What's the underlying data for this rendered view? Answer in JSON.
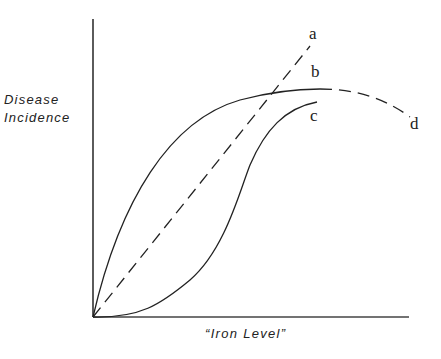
{
  "diagram": {
    "y_axis_label_line1": "Disease",
    "y_axis_label_line2": "Incidence",
    "x_axis_label": "“Iron Level”",
    "curves": [
      {
        "id": "a",
        "label": "a",
        "style": "dashed",
        "shape": "linear increase"
      },
      {
        "id": "b",
        "label": "b",
        "style": "solid",
        "shape": "rapid rise then plateau"
      },
      {
        "id": "c",
        "label": "c",
        "style": "solid",
        "shape": "sigmoid"
      },
      {
        "id": "d",
        "label": "d",
        "style": "dashed",
        "shape": "decline after plateau (continuation of b)"
      }
    ],
    "colors": {
      "line": "#222222",
      "background": "#ffffff"
    }
  }
}
